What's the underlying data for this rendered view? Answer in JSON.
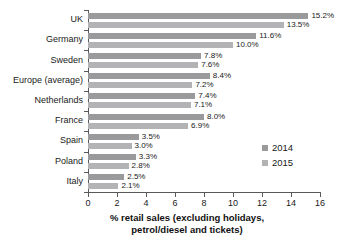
{
  "chart_data": {
    "type": "bar",
    "orientation": "horizontal",
    "title": "",
    "xlabel_line1": "% retail sales (excluding holidays,",
    "xlabel_line2": "petrol/diesel and tickets)",
    "ylabel": "",
    "xlim": [
      0,
      16
    ],
    "xticks": [
      0,
      2,
      4,
      6,
      8,
      10,
      12,
      14,
      16
    ],
    "xtick_labels": [
      "0",
      "2",
      "4",
      "6",
      "8",
      "10",
      "12",
      "14",
      "16"
    ],
    "grid": false,
    "legend_position": "right",
    "categories": [
      "UK",
      "Germany",
      "Sweden",
      "Europe (average)",
      "Netherlands",
      "France",
      "Spain",
      "Poland",
      "Italy"
    ],
    "series": [
      {
        "name": "2014",
        "color": "#9a9a9c",
        "values": [
          15.2,
          11.6,
          7.8,
          8.4,
          7.4,
          8.0,
          3.5,
          3.3,
          2.5
        ],
        "labels": [
          "15.2%",
          "11.6%",
          "7.8%",
          "8.4%",
          "7.4%",
          "8.0%",
          "3.5%",
          "3.3%",
          "2.5%"
        ]
      },
      {
        "name": "2015",
        "color": "#b3b3b5",
        "values": [
          13.5,
          10.0,
          7.6,
          7.2,
          7.1,
          6.9,
          3.0,
          2.8,
          2.1
        ],
        "labels": [
          "13.5%",
          "10.0%",
          "7.6%",
          "7.2%",
          "7.1%",
          "6.9%",
          "3.0%",
          "2.8%",
          "2.1%"
        ]
      }
    ]
  },
  "legend": {
    "items": [
      {
        "label": "2014",
        "color": "#9a9a9c"
      },
      {
        "label": "2015",
        "color": "#b3b3b5"
      }
    ]
  }
}
